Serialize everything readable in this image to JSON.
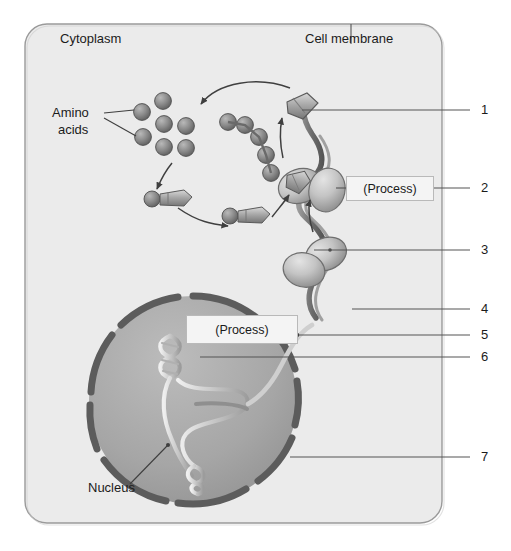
{
  "diagram": {
    "title_alt": "Protein synthesis in a cell",
    "canvas": {
      "width": 511,
      "height": 551,
      "background": "#ffffff"
    },
    "colors": {
      "cytoplasm_fill": "#ebebeb",
      "cell_border": "#9a9a9a",
      "nucleus_fill": "#a8a8a8",
      "nuclear_envelope": "#5c5c5c",
      "organelle_dark": "#6e6e6e",
      "organelle_light": "#cfcfcf",
      "leader_line": "#555555",
      "text": "#1b1b1b",
      "process_box_fill": "#f4f4f4",
      "process_box_border": "#b9b9b9"
    },
    "text_labels": [
      {
        "id": "cytoplasm",
        "text": "Cytoplasm",
        "x": 60,
        "y": 38
      },
      {
        "id": "cell-membrane",
        "text": "Cell membrane",
        "x": 305,
        "y": 38
      },
      {
        "id": "amino-acids-1",
        "text": "Amino",
        "x": 52,
        "y": 113
      },
      {
        "id": "amino-acids-2",
        "text": "acids",
        "x": 58,
        "y": 130
      },
      {
        "id": "nucleus",
        "text": "Nucleus",
        "x": 88,
        "y": 488
      }
    ],
    "process_boxes": [
      {
        "id": "process-upper",
        "text": "(Process)",
        "x": 346,
        "y": 176,
        "w": 86,
        "h": 22
      },
      {
        "id": "process-lower",
        "text": "(Process)",
        "x": 186,
        "y": 315,
        "w": 110,
        "h": 26
      }
    ],
    "numbered_callouts": [
      {
        "number": "1",
        "y": 110,
        "text_x": 481,
        "line_from_x": 302,
        "line_to_x": 470
      },
      {
        "number": "2",
        "y": 188,
        "text_x": 481,
        "line_from_x": 432,
        "line_to_x": 470
      },
      {
        "number": "3",
        "y": 250,
        "text_x": 481,
        "line_from_x": 314,
        "line_to_x": 470
      },
      {
        "number": "4",
        "y": 309,
        "text_x": 481,
        "line_from_x": 352,
        "line_to_x": 470
      },
      {
        "number": "5",
        "y": 335,
        "text_x": 481,
        "line_from_x": 296,
        "line_to_x": 470
      },
      {
        "number": "6",
        "y": 357,
        "text_x": 481,
        "line_from_x": 200,
        "line_to_x": 470
      },
      {
        "number": "7",
        "y": 457,
        "text_x": 481,
        "line_from_x": 290,
        "line_to_x": 470
      }
    ],
    "structures": {
      "cell": {
        "x": 25,
        "y": 24,
        "w": 417,
        "h": 499,
        "corner_radius": 22
      },
      "nucleus": {
        "cx": 193,
        "cy": 400,
        "r": 106
      },
      "amino_acid_count": 7,
      "mrna_bead_count": 5,
      "trna_count": 2,
      "ribosome_count": 2,
      "nuclear_pore_gap_count": 7
    }
  }
}
